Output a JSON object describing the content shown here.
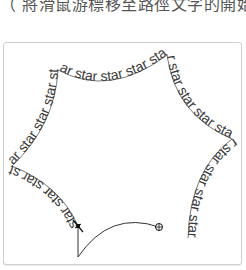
{
  "caption": {
    "text": "（ 將滑鼠游標移至路徑文字的開始處"
  },
  "canvas": {
    "path_text": "star star star star star star star star star star star star star star star star star star star star star star star star star",
    "text_color": "#3a3a3a",
    "path_color": "#333333",
    "frame_border": "#cfcfcf"
  },
  "cursor": {
    "type": "text-on-path-cursor",
    "end_marker": "crosshair-circle"
  }
}
